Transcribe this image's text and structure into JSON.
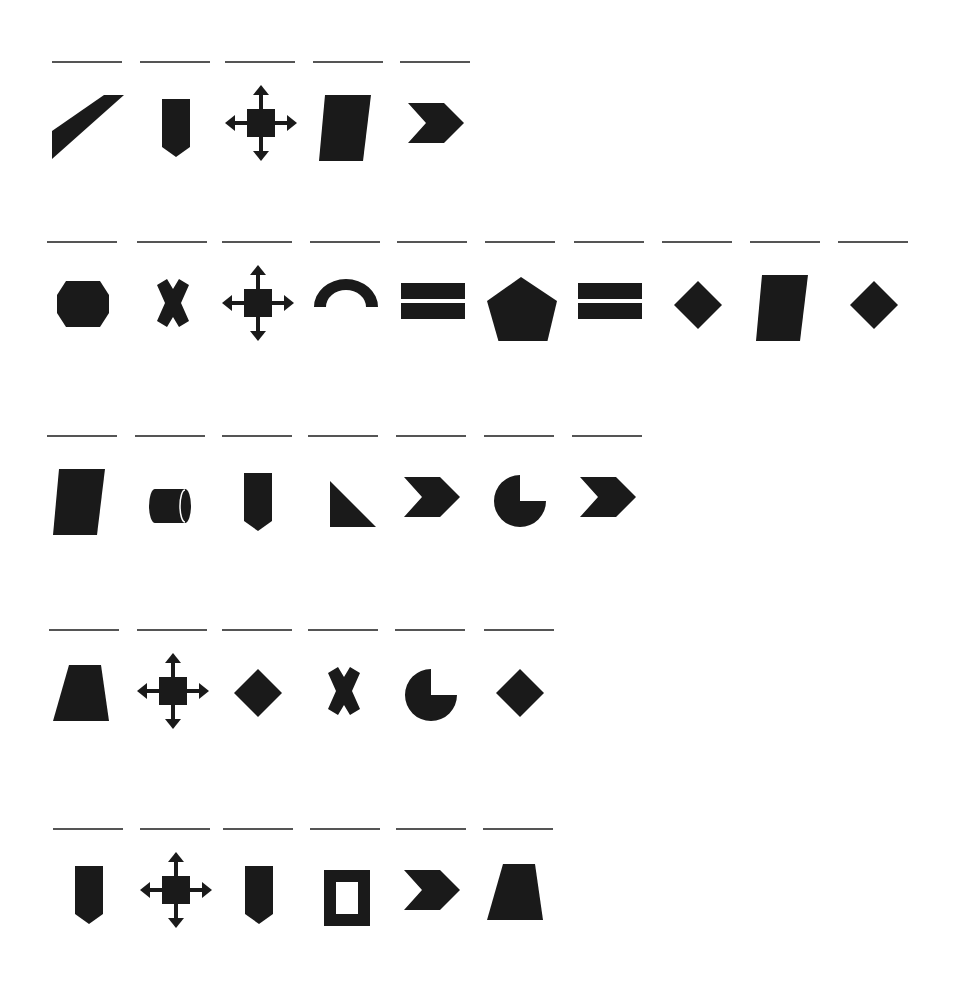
{
  "fill_color": "#1a1a1a",
  "line_color": "#555555",
  "rows": [
    {
      "y": 61,
      "cells": [
        {
          "x": 52,
          "shape": "parallelogram-slash-icon"
        },
        {
          "x": 140,
          "shape": "pentagon-banner-icon"
        },
        {
          "x": 225,
          "shape": "move-arrows-icon"
        },
        {
          "x": 313,
          "shape": "parallelogram-tall-icon"
        },
        {
          "x": 400,
          "shape": "chevron-icon"
        }
      ]
    },
    {
      "y": 241,
      "cells": [
        {
          "x": 47,
          "shape": "octagon-icon"
        },
        {
          "x": 137,
          "shape": "cross-x-icon"
        },
        {
          "x": 222,
          "shape": "move-arrows-icon"
        },
        {
          "x": 310,
          "shape": "arch-icon"
        },
        {
          "x": 397,
          "shape": "equals-icon"
        },
        {
          "x": 485,
          "shape": "pentagon-icon"
        },
        {
          "x": 574,
          "shape": "equals-icon"
        },
        {
          "x": 662,
          "shape": "diamond-icon"
        },
        {
          "x": 750,
          "shape": "parallelogram-tall-icon"
        },
        {
          "x": 838,
          "shape": "diamond-icon"
        }
      ]
    },
    {
      "y": 435,
      "cells": [
        {
          "x": 47,
          "shape": "parallelogram-tall-icon"
        },
        {
          "x": 135,
          "shape": "cylinder-icon"
        },
        {
          "x": 222,
          "shape": "pentagon-banner-icon"
        },
        {
          "x": 308,
          "shape": "right-triangle-icon"
        },
        {
          "x": 396,
          "shape": "chevron-icon"
        },
        {
          "x": 484,
          "shape": "pie-three-quarter-icon"
        },
        {
          "x": 572,
          "shape": "chevron-icon"
        }
      ]
    },
    {
      "y": 629,
      "cells": [
        {
          "x": 49,
          "shape": "trapezoid-icon"
        },
        {
          "x": 137,
          "shape": "move-arrows-icon"
        },
        {
          "x": 222,
          "shape": "diamond-icon"
        },
        {
          "x": 308,
          "shape": "cross-x-icon"
        },
        {
          "x": 395,
          "shape": "pie-three-quarter-icon"
        },
        {
          "x": 484,
          "shape": "diamond-icon"
        }
      ]
    },
    {
      "y": 828,
      "cells": [
        {
          "x": 53,
          "shape": "pentagon-banner-icon"
        },
        {
          "x": 140,
          "shape": "move-arrows-icon"
        },
        {
          "x": 223,
          "shape": "pentagon-banner-icon"
        },
        {
          "x": 310,
          "shape": "square-frame-icon"
        },
        {
          "x": 396,
          "shape": "chevron-icon"
        },
        {
          "x": 483,
          "shape": "trapezoid-icon"
        }
      ]
    }
  ]
}
